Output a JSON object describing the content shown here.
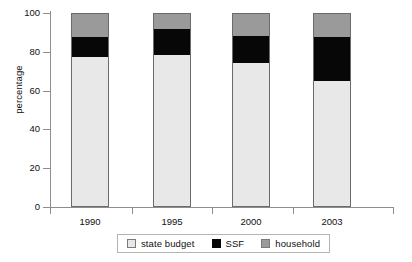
{
  "chart_data": {
    "type": "bar",
    "subtype": "stacked-bar",
    "title": "",
    "xlabel": "",
    "ylabel": "percentage",
    "categories": [
      "1990",
      "1995",
      "2000",
      "2003"
    ],
    "ylim": [
      0,
      100
    ],
    "yticks": [
      0,
      20,
      40,
      60,
      80,
      100
    ],
    "ytick_labels": [
      "0",
      "20",
      "40",
      "60",
      "80",
      "100"
    ],
    "grid": false,
    "legend_position": "bottom",
    "stack_order_bottom_to_top": [
      "state budget",
      "SSF",
      "household"
    ],
    "series": [
      {
        "name": "state budget",
        "color": "#e8e8e8",
        "values": [
          77.5,
          78.5,
          74.0,
          65.0
        ]
      },
      {
        "name": "SSF",
        "color": "#070707",
        "values": [
          10.0,
          13.5,
          14.0,
          22.5
        ]
      },
      {
        "name": "household",
        "color": "#9a9a9a",
        "values": [
          12.5,
          8.0,
          12.0,
          12.5
        ]
      }
    ],
    "cumulative_tops": [
      {
        "category": "1990",
        "state_budget_top": 77.5,
        "ssf_top": 87.5,
        "household_top": 100
      },
      {
        "category": "1995",
        "state_budget_top": 78.5,
        "ssf_top": 92.0,
        "household_top": 100
      },
      {
        "category": "2000",
        "state_budget_top": 74.0,
        "ssf_top": 88.0,
        "household_top": 100
      },
      {
        "category": "2003",
        "state_budget_top": 65.0,
        "ssf_top": 87.5,
        "household_top": 100
      }
    ]
  },
  "legend": {
    "items": [
      {
        "label": "state budget",
        "swatch": "state-budget-swatch"
      },
      {
        "label": "SSF",
        "swatch": "ssf-swatch"
      },
      {
        "label": "household",
        "swatch": "household-swatch"
      }
    ]
  },
  "colors": {
    "state_budget": "#e8e8e8",
    "ssf": "#070707",
    "household": "#9a9a9a",
    "axis": "#8e8e8e",
    "bar_outline": "#6b6b6b",
    "text": "#111111",
    "background": "#ffffff"
  }
}
